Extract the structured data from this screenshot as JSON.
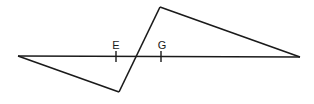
{
  "diagram": {
    "stroke_color": "#1a1a1a",
    "background": "#ffffff",
    "points": {
      "left": {
        "x": 18,
        "y": 56
      },
      "right": {
        "x": 300,
        "y": 57
      },
      "top": {
        "x": 160,
        "y": 7
      },
      "bottom": {
        "x": 119,
        "y": 92
      }
    },
    "labels": {
      "E": "E",
      "G": "G"
    },
    "ticks": {
      "E": {
        "x": 116
      },
      "G": {
        "x": 161
      }
    }
  }
}
